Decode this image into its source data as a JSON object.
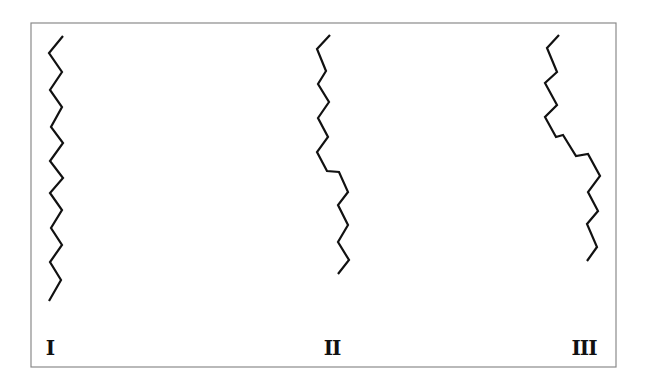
{
  "figure": {
    "frame": {
      "x": 31,
      "y": 23,
      "width": 585,
      "height": 344,
      "stroke": "#8a8a8a"
    },
    "line_color": "#111111",
    "chains": [
      {
        "id": "I",
        "label": "I",
        "label_pos": {
          "x": 50,
          "y": 338
        },
        "points": [
          [
            63,
            36
          ],
          [
            49,
            53
          ],
          [
            62,
            72
          ],
          [
            50,
            90
          ],
          [
            62,
            107
          ],
          [
            51,
            127
          ],
          [
            63,
            143
          ],
          [
            50,
            161
          ],
          [
            63,
            178
          ],
          [
            50,
            193
          ],
          [
            62,
            210
          ],
          [
            51,
            228
          ],
          [
            62,
            245
          ],
          [
            50,
            262
          ],
          [
            61,
            280
          ],
          [
            49,
            301
          ]
        ]
      },
      {
        "id": "II",
        "label": "II",
        "label_pos": {
          "x": 332,
          "y": 338
        },
        "points": [
          [
            330,
            35
          ],
          [
            317,
            49
          ],
          [
            326,
            71
          ],
          [
            318,
            84
          ],
          [
            329,
            102
          ],
          [
            318,
            118
          ],
          [
            328,
            137
          ],
          [
            317,
            152
          ],
          [
            327,
            171
          ],
          [
            339,
            172
          ],
          [
            348,
            192
          ],
          [
            338,
            205
          ],
          [
            348,
            225
          ],
          [
            338,
            242
          ],
          [
            349,
            260
          ],
          [
            338,
            274
          ]
        ]
      },
      {
        "id": "III",
        "label": "III",
        "label_pos": {
          "x": 584,
          "y": 338
        },
        "points": [
          [
            559,
            35
          ],
          [
            547,
            48
          ],
          [
            557,
            72
          ],
          [
            545,
            83
          ],
          [
            557,
            105
          ],
          [
            545,
            117
          ],
          [
            556,
            137
          ],
          [
            563,
            135
          ],
          [
            576,
            156
          ],
          [
            588,
            154
          ],
          [
            600,
            176
          ],
          [
            588,
            192
          ],
          [
            598,
            211
          ],
          [
            587,
            224
          ],
          [
            597,
            247
          ],
          [
            587,
            261
          ]
        ]
      }
    ]
  }
}
